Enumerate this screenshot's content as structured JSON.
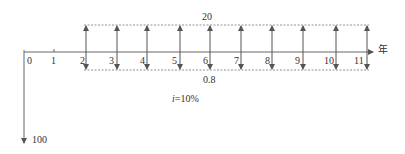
{
  "diagram": {
    "type": "cash-flow-diagram",
    "axis_unit_label": "年",
    "periods": [
      "0",
      "1",
      "2",
      "3",
      "4",
      "5",
      "6",
      "7",
      "8",
      "9",
      "10",
      "11"
    ],
    "inflow": {
      "label": "20",
      "from_period": 2,
      "to_period": 11,
      "direction": "up"
    },
    "outflow_recurring": {
      "label": "0.8",
      "from_period": 2,
      "to_period": 11,
      "direction": "down"
    },
    "initial_outflow": {
      "label": "100",
      "period": 0,
      "direction": "down"
    },
    "interest_rate": {
      "symbol": "i",
      "label": "=10%"
    }
  }
}
